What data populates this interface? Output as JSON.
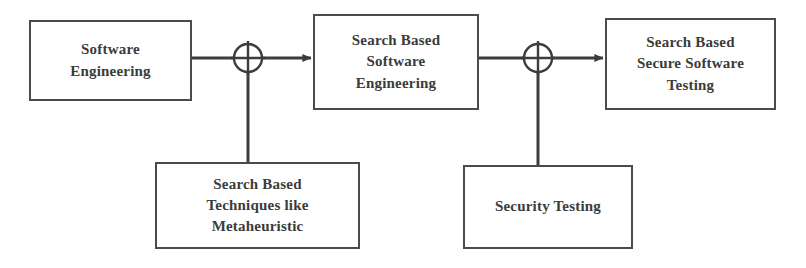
{
  "diagram": {
    "type": "block-flow-diagram",
    "background_color": "#ffffff",
    "line_color": "#4b4b4b",
    "text_color": "#3b3b3b",
    "nodes": [
      {
        "id": "software-engineering",
        "label": "Software\nEngineering",
        "x": 29,
        "y": 20,
        "width": 163,
        "height": 81
      },
      {
        "id": "search-based-software-engineering",
        "label": "Search Based\nSoftware\nEngineering",
        "x": 313,
        "y": 14,
        "width": 166,
        "height": 96
      },
      {
        "id": "search-based-secure-software-testing",
        "label": "Search Based\nSecure Software\nTesting",
        "x": 605,
        "y": 18,
        "width": 171,
        "height": 92
      },
      {
        "id": "search-based-techniques",
        "label": "Search Based\nTechniques like\nMetaheuristic",
        "x": 155,
        "y": 162,
        "width": 205,
        "height": 87
      },
      {
        "id": "security-testing",
        "label": "Security Testing",
        "x": 463,
        "y": 165,
        "width": 170,
        "height": 84
      }
    ],
    "junctions": [
      {
        "id": "summing-junction-1",
        "cx": 248,
        "cy": 58,
        "r": 14
      },
      {
        "id": "summing-junction-2",
        "cx": 538,
        "cy": 58,
        "r": 14
      }
    ],
    "connections": [
      {
        "id": "se-to-junction-1",
        "from": "software-engineering",
        "to": "summing-junction-1",
        "arrow": false
      },
      {
        "id": "junction-1-to-sbse",
        "from": "summing-junction-1",
        "to": "search-based-software-engineering",
        "arrow": true
      },
      {
        "id": "techniques-to-junction-1",
        "from": "search-based-techniques",
        "to": "summing-junction-1",
        "arrow": false
      },
      {
        "id": "sbse-to-junction-2",
        "from": "search-based-software-engineering",
        "to": "summing-junction-2",
        "arrow": false
      },
      {
        "id": "junction-2-to-sbsst",
        "from": "summing-junction-2",
        "to": "search-based-secure-software-testing",
        "arrow": true
      },
      {
        "id": "security-testing-to-junction-2",
        "from": "security-testing",
        "to": "summing-junction-2",
        "arrow": false
      }
    ]
  }
}
